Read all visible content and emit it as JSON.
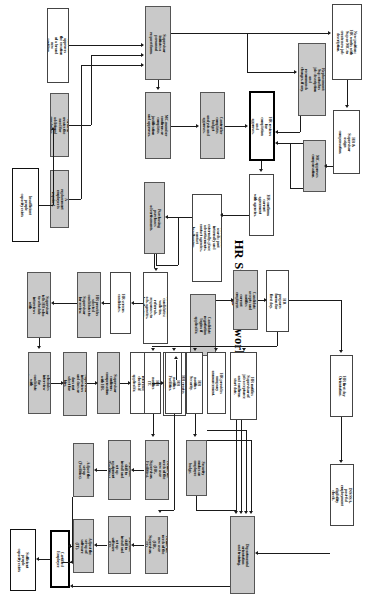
{
  "diagram": {
    "title": "HR Staffing Network",
    "orientation": "rotated-90-landscape-on-portrait-page"
  },
  "nodes": {
    "n01": "The MC approves the creation of a brand new position.",
    "n02": "Growth creates the need for additional employees.",
    "n03": "Insufficient people capacity exists",
    "n04": "A replacement employee is required.",
    "n05": "Supervisor initiates a personnel request form.",
    "n06": "New position: HR works with Sup or MC to create new job description.",
    "n07": "Replacement: Sup attaches job description and recommends changes, if any.",
    "n08": "MC member confirms or completes justification and approves.",
    "n09": "Controller completes budget analysis and approves.",
    "n10": "HR reviews for completion and approves.",
    "n11": "HR & Supervisor assign compensation.",
    "n12": "MC approves compensation.",
    "n13": "HR confirms current agreement with agencies.",
    "n14": "HR initiates search: post internally and externally, place advertisements, contact agencies, contact headhunters.",
    "n15": "Purchasing purchases advertisements.",
    "n16": "HR identifies candidates: walk-ins, referrals, responses to ads, agencies, headhunters.",
    "n17": "HR screens candidates.",
    "n18": "HR provides selected candidates to Supervisor for review.",
    "n19": "Supervisor tells HR who to schedule interviews with",
    "n20": "HR schedules interview for candidate with Supervisor",
    "n21": "Supervisor interviews and does or does not select for hire.",
    "n22": "Supervisor confirms compensation with HR.",
    "n23": "HR does reference checks if applicable.",
    "n24": "HR creates offer documentation and makes offer.",
    "n25": "Candidate negotiation begins if applicable.",
    "n26": "Candidate accepts and notifies current employer.",
    "n27": "HR notifies Supervisor of job acceptance and confirms start date.",
    "n28": "HR prepares forms for first day.",
    "n29": "HR first day Orientation.",
    "n30": "HR provides company announcement.",
    "n31": "HR notifies Security.",
    "n32": "HR notifies Facilities.",
    "n33": "HR notifies IT.",
    "n34": "Security makes an employee badge.",
    "n35": "Define the needs of the new user (HR, Supervisor, Facilities).",
    "n36": "Define the needs of the new user (HR, Supervisor, IT).",
    "n37": "Schedule skill to install and set up equipment (Facilities).",
    "n38": "Schedule skill to install and set up software (IT).",
    "n39": "Adjust the set-up (Facilities).",
    "n40": "Adjust the set-up of software (IT).",
    "n41": "INS/SSA, post-ful employment eligibility check.",
    "n42": "Departmental orientation and training.",
    "n43": "Certified Employee",
    "n44": "Sufficient people capacity exists"
  }
}
